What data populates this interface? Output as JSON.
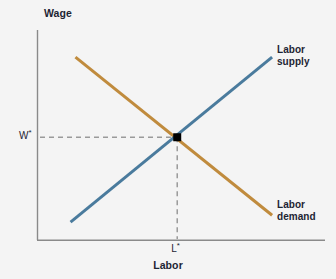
{
  "chart_data": {
    "type": "line",
    "title": "",
    "subtitle": "",
    "xlabel": "Labor",
    "ylabel": "Wage",
    "grid": false,
    "legend_position": "inline-right",
    "xlim": [
      0,
      100
    ],
    "ylim": [
      0,
      100
    ],
    "x_tick_labels": [
      "L*"
    ],
    "y_tick_labels": [
      "W*"
    ],
    "annotations": [
      {
        "name": "equilibrium-point",
        "label": "",
        "marker": "square",
        "color": "#000000",
        "x": 48.6,
        "y": 49.0
      },
      {
        "name": "equilibrium-wage-guide",
        "label": "W*",
        "orientation": "horizontal",
        "style": "dashed",
        "color": "#9a9a9a",
        "y": 49.0
      },
      {
        "name": "equilibrium-labor-guide",
        "label": "L*",
        "orientation": "vertical",
        "style": "dashed",
        "color": "#9a9a9a",
        "x": 48.6
      }
    ],
    "series": [
      {
        "name": "Labor supply",
        "label_line1": "Labor",
        "label_line2": "supply",
        "color": "#4a7b9d",
        "slope": "upward",
        "points": [
          {
            "x": 11.5,
            "y": 8.6
          },
          {
            "x": 81.6,
            "y": 87.1
          }
        ]
      },
      {
        "name": "Labor demand",
        "label_line1": "Labor",
        "label_line2": "demand",
        "color": "#c08b3d",
        "slope": "downward",
        "points": [
          {
            "x": 13.2,
            "y": 87.1
          },
          {
            "x": 81.6,
            "y": 11.9
          }
        ]
      }
    ]
  },
  "axes": {
    "y_title": "Wage",
    "x_title": "Labor",
    "axis_color": "#8a8a8a"
  },
  "labels": {
    "wage_star_base": "W",
    "wage_star_sup": "*",
    "labor_star_base": "L",
    "labor_star_sup": "*"
  },
  "colors": {
    "background": "#f4f4f4",
    "supply": "#4a7b9d",
    "demand": "#c08b3d",
    "axis": "#8a8a8a",
    "guide": "#9a9a9a",
    "marker": "#000000",
    "text": "#1d2433"
  }
}
